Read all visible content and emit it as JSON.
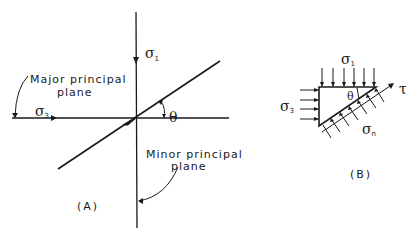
{
  "figure": {
    "panel_a": {
      "caption": "(A)",
      "sigma1_label": "σ",
      "sigma1_sub": "1",
      "sigma3_label": "σ",
      "sigma3_sub": "3",
      "theta_label": "θ",
      "major_plane_line1": "Major principal",
      "major_plane_line2": "plane",
      "minor_plane_line1": "Minor principal",
      "minor_plane_line2": "plane"
    },
    "panel_b": {
      "caption": "(B)",
      "sigma1_label": "σ",
      "sigma1_sub": "1",
      "sigma3_label": "σ",
      "sigma3_sub": "3",
      "theta_label": "θ",
      "tau_label": "τ",
      "sigman_label": "σ",
      "sigman_sub": "n"
    }
  },
  "colors": {
    "ink": "#1a1a1a",
    "background": "#ffffff"
  }
}
